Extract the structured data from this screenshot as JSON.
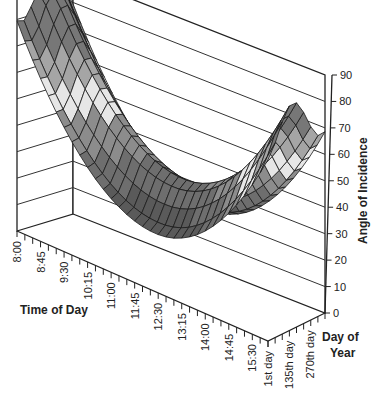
{
  "chart_data": {
    "type": "surface3d",
    "title": "",
    "xlabel": "Time of Day",
    "ylabel": "Day of Year",
    "zlabel": "Angle of Incidence",
    "x_categories": [
      "8:00",
      "8:15",
      "8:30",
      "8:45",
      "9:00",
      "9:15",
      "9:30",
      "9:45",
      "10:00",
      "10:15",
      "10:30",
      "10:45",
      "11:00",
      "11:15",
      "11:30",
      "11:45",
      "12:00",
      "12:15",
      "12:30",
      "12:45",
      "13:00",
      "13:15",
      "13:30",
      "13:45",
      "14:00",
      "14:15",
      "14:30",
      "14:45",
      "15:00",
      "15:15",
      "15:30",
      "15:45",
      "16:00"
    ],
    "x_tick_labels": [
      "8:00",
      "8:45",
      "9:30",
      "10:15",
      "11:00",
      "11:45",
      "12:30",
      "13:15",
      "14:00",
      "14:45",
      "15:30"
    ],
    "y_categories": [
      "1st day",
      "45th day",
      "90th day",
      "135th day",
      "180th day",
      "225th day",
      "270th day",
      "315th day",
      "365th day"
    ],
    "y_tick_labels": [
      "1st day",
      "135th day",
      "270th day"
    ],
    "z_ticks": [
      0,
      10,
      20,
      30,
      40,
      50,
      60,
      70,
      80,
      90
    ],
    "zlim": [
      0,
      90
    ],
    "grid": true,
    "series_note": "Angle of incidence surface: high (~80-85) at 8:00, minimum ~20-25 near 12:00-12:30, rising to ~70-75 at 16:00; varies with day of year",
    "surface_profile": {
      "morning_8am_range": [
        60,
        85
      ],
      "midday_min_range": [
        22,
        48
      ],
      "afternoon_4pm_range": [
        55,
        75
      ]
    },
    "colors": {
      "surface_dark": "#5a5a5a",
      "surface_mid": "#8c8c8c",
      "surface_light": "#e6e6e6",
      "mesh": "#1a1a1a"
    }
  }
}
